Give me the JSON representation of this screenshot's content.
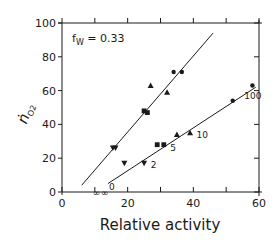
{
  "chart_data": {
    "type": "scatter",
    "title": "",
    "annotation": "fW = 0.33",
    "annotation_main": "f",
    "annotation_sub": "W",
    "annotation_value": " = 0.33",
    "xlabel": "Relative activity",
    "ylabel": "ṅO2",
    "ylabel_main": "ṅ",
    "ylabel_sub": "O2",
    "xlim": [
      0,
      60
    ],
    "ylim": [
      0,
      100
    ],
    "x_ticks": [
      0,
      20,
      40,
      60
    ],
    "x_tick_labels": [
      "0",
      "20",
      "40",
      "60"
    ],
    "x_minor_ticks": [
      10,
      30,
      50
    ],
    "y_ticks": [
      0,
      20,
      40,
      60,
      80,
      100
    ],
    "y_tick_labels": [
      "0",
      "20",
      "40",
      "60",
      "80",
      "100"
    ],
    "grid": false,
    "legend": "none",
    "series": [
      {
        "name": "upper",
        "fit_line": {
          "x": [
            6,
            46
          ],
          "y": [
            4,
            94
          ]
        },
        "points": [
          {
            "x": 15.5,
            "y": 26,
            "marker": "triangle-down"
          },
          {
            "x": 16.3,
            "y": 26,
            "marker": "triangle-down"
          },
          {
            "x": 25.0,
            "y": 48,
            "marker": "square"
          },
          {
            "x": 26.0,
            "y": 47,
            "marker": "square"
          },
          {
            "x": 27.0,
            "y": 63,
            "marker": "triangle-up"
          },
          {
            "x": 32.0,
            "y": 59,
            "marker": "triangle-up"
          },
          {
            "x": 34.0,
            "y": 71,
            "marker": "circle"
          },
          {
            "x": 36.5,
            "y": 71,
            "marker": "circle"
          }
        ]
      },
      {
        "name": "lower",
        "fit_line": {
          "x": [
            14,
            59
          ],
          "y": [
            5,
            62
          ]
        },
        "points": [
          {
            "x": 19.0,
            "y": 17,
            "marker": "triangle-down"
          },
          {
            "x": 25.0,
            "y": 17,
            "marker": "triangle-down"
          },
          {
            "x": 29.0,
            "y": 28,
            "marker": "square"
          },
          {
            "x": 31.0,
            "y": 28,
            "marker": "square"
          },
          {
            "x": 35.0,
            "y": 34,
            "marker": "triangle-up"
          },
          {
            "x": 39.0,
            "y": 35,
            "marker": "triangle-up"
          },
          {
            "x": 52.0,
            "y": 54,
            "marker": "circle"
          },
          {
            "x": 58.0,
            "y": 63,
            "marker": "circle"
          }
        ],
        "point_labels": [
          {
            "text": "0",
            "x": 14.3,
            "y": 3
          },
          {
            "text": "2",
            "x": 27.0,
            "y": 16
          },
          {
            "text": "5",
            "x": 33.0,
            "y": 26
          },
          {
            "text": "10",
            "x": 41.0,
            "y": 34
          },
          {
            "text": "100",
            "x": 55.5,
            "y": 57
          }
        ]
      }
    ],
    "axis_symbols": [
      {
        "text": "∞",
        "x": 10.5,
        "y": 0
      },
      {
        "text": "∞",
        "x": 13.0,
        "y": 0
      }
    ]
  }
}
